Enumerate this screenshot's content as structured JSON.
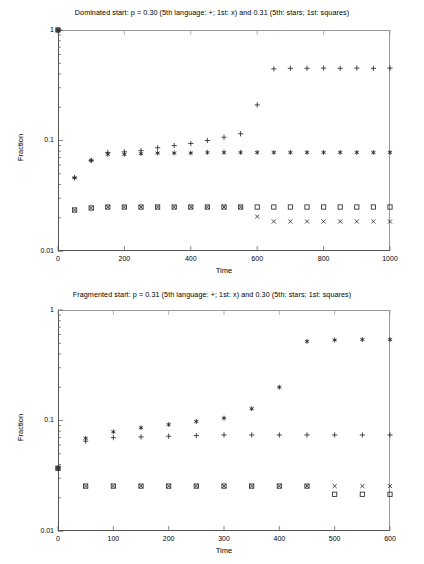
{
  "figure": {
    "width": 424,
    "height": 564,
    "background": "#ffffff",
    "foreground": "#000000"
  },
  "chart_data": [
    {
      "id": "dominated-start",
      "type": "scatter",
      "title": "Dominated start: p = 0.30 (5th language: +; 1st: x) and 0.31 (5th: stars; 1st: squares)",
      "xlabel": "Time",
      "ylabel": "Fraction",
      "xlim": [
        0,
        1000
      ],
      "ylim": [
        0.01,
        1
      ],
      "yscale": "log",
      "xticks": [
        0,
        200,
        400,
        600,
        800,
        1000
      ],
      "xtick_labels": [
        "0",
        "200",
        "400",
        "600",
        "800",
        "1000"
      ],
      "yticks": [
        0.01,
        0.1,
        1
      ],
      "ytick_labels": [
        "0.01",
        "0.1",
        "1"
      ],
      "grid": false,
      "legend_in_title": true,
      "series": [
        {
          "name": "5th language (p = 0.30)",
          "marker": "plus",
          "x": [
            0,
            50,
            100,
            150,
            200,
            250,
            300,
            350,
            400,
            450,
            500,
            550,
            600,
            650,
            700,
            750,
            800,
            850,
            900,
            950,
            1000
          ],
          "y": [
            1.0,
            0.046,
            0.066,
            0.078,
            0.079,
            0.081,
            0.086,
            0.09,
            0.094,
            0.1,
            0.107,
            0.115,
            0.21,
            0.445,
            0.45,
            0.45,
            0.452,
            0.45,
            0.452,
            0.45,
            0.452
          ]
        },
        {
          "name": "1st language (p = 0.30)",
          "marker": "cross",
          "x": [
            0,
            50,
            100,
            150,
            200,
            250,
            300,
            350,
            400,
            450,
            500,
            550,
            600,
            650,
            700,
            750,
            800,
            850,
            900,
            950,
            1000
          ],
          "y": [
            1.0,
            0.0235,
            0.0245,
            0.025,
            0.025,
            0.025,
            0.025,
            0.025,
            0.025,
            0.025,
            0.025,
            0.025,
            0.0205,
            0.0185,
            0.0185,
            0.0185,
            0.0185,
            0.0185,
            0.0185,
            0.0185,
            0.0185
          ]
        },
        {
          "name": "5th language (p = 0.31)",
          "marker": "star",
          "x": [
            0,
            50,
            100,
            150,
            200,
            250,
            300,
            350,
            400,
            450,
            500,
            550,
            600,
            650,
            700,
            750,
            800,
            850,
            900,
            950,
            1000
          ],
          "y": [
            1.0,
            0.046,
            0.066,
            0.075,
            0.075,
            0.076,
            0.077,
            0.077,
            0.077,
            0.078,
            0.078,
            0.078,
            0.078,
            0.078,
            0.078,
            0.078,
            0.078,
            0.078,
            0.078,
            0.078,
            0.078
          ]
        },
        {
          "name": "1st language (p = 0.31)",
          "marker": "square",
          "x": [
            0,
            50,
            100,
            150,
            200,
            250,
            300,
            350,
            400,
            450,
            500,
            550,
            600,
            650,
            700,
            750,
            800,
            850,
            900,
            950,
            1000
          ],
          "y": [
            1.0,
            0.0235,
            0.0245,
            0.025,
            0.025,
            0.025,
            0.025,
            0.025,
            0.025,
            0.025,
            0.025,
            0.025,
            0.025,
            0.025,
            0.025,
            0.025,
            0.025,
            0.025,
            0.025,
            0.025,
            0.025
          ]
        }
      ]
    },
    {
      "id": "fragmented-start",
      "type": "scatter",
      "title": "Fragmented start: p = 0.31 (5th language: +; 1st: x) and 0.30 (5th: stars; 1st: squares)",
      "xlabel": "Time",
      "ylabel": "Fraction",
      "xlim": [
        0,
        600
      ],
      "ylim": [
        0.01,
        1
      ],
      "yscale": "log",
      "xticks": [
        0,
        100,
        200,
        300,
        400,
        500,
        600
      ],
      "xtick_labels": [
        "0",
        "100",
        "200",
        "300",
        "400",
        "500",
        "600"
      ],
      "yticks": [
        0.01,
        0.1,
        1
      ],
      "ytick_labels": [
        "0.01",
        "0.1",
        "1"
      ],
      "grid": false,
      "legend_in_title": true,
      "series": [
        {
          "name": "5th language (p = 0.31)",
          "marker": "plus",
          "x": [
            0,
            50,
            100,
            150,
            200,
            250,
            300,
            350,
            400,
            450,
            500,
            550,
            600
          ],
          "y": [
            0.037,
            0.065,
            0.07,
            0.071,
            0.072,
            0.073,
            0.074,
            0.074,
            0.074,
            0.074,
            0.074,
            0.074,
            0.074
          ]
        },
        {
          "name": "1st language (p = 0.31)",
          "marker": "cross",
          "x": [
            0,
            50,
            100,
            150,
            200,
            250,
            300,
            350,
            400,
            450,
            500,
            550,
            600
          ],
          "y": [
            0.037,
            0.0255,
            0.0255,
            0.0255,
            0.0255,
            0.0255,
            0.0255,
            0.0255,
            0.0255,
            0.0255,
            0.0255,
            0.0255,
            0.0255
          ]
        },
        {
          "name": "5th language (p = 0.30)",
          "marker": "star",
          "x": [
            0,
            50,
            100,
            150,
            200,
            250,
            300,
            350,
            400,
            450,
            500,
            550,
            600
          ],
          "y": [
            0.037,
            0.069,
            0.079,
            0.086,
            0.092,
            0.098,
            0.105,
            0.128,
            0.2,
            0.52,
            0.535,
            0.54,
            0.54
          ]
        },
        {
          "name": "1st language (p = 0.30)",
          "marker": "square",
          "x": [
            0,
            50,
            100,
            150,
            200,
            250,
            300,
            350,
            400,
            450,
            500,
            550,
            600
          ],
          "y": [
            0.037,
            0.0255,
            0.0255,
            0.0255,
            0.0255,
            0.0255,
            0.0255,
            0.0255,
            0.0255,
            0.0255,
            0.0215,
            0.0215,
            0.0215
          ]
        }
      ]
    }
  ]
}
